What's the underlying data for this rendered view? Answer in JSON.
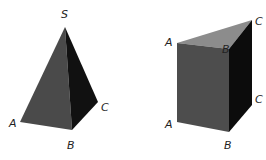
{
  "pyramid": {
    "labels": {
      "S": "S",
      "A": "A",
      "B": "B",
      "C": "C"
    },
    "colors": {
      "left_face": "#4a4a4a",
      "right_face": "#111111"
    }
  },
  "prism": {
    "labels": {
      "A_top": "A",
      "B_top": "B",
      "C_top": "C",
      "A_bottom": "A",
      "B_bottom": "B",
      "C_bottom": "C"
    },
    "colors": {
      "top_face": "#8c8c8c",
      "front_face": "#4d4d4d",
      "side_face": "#0c0c0c"
    }
  }
}
